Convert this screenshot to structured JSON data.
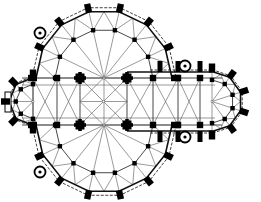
{
  "diagram": {
    "type": "architectural-floor-plan",
    "elements": {
      "crossing": "central square bay with star vault",
      "apses": [
        "north",
        "south",
        "west",
        "east"
      ],
      "stair_turrets": 4,
      "colors": {
        "walls": "#000000",
        "vault_lines": "#555555",
        "background": "#ffffff"
      }
    }
  }
}
